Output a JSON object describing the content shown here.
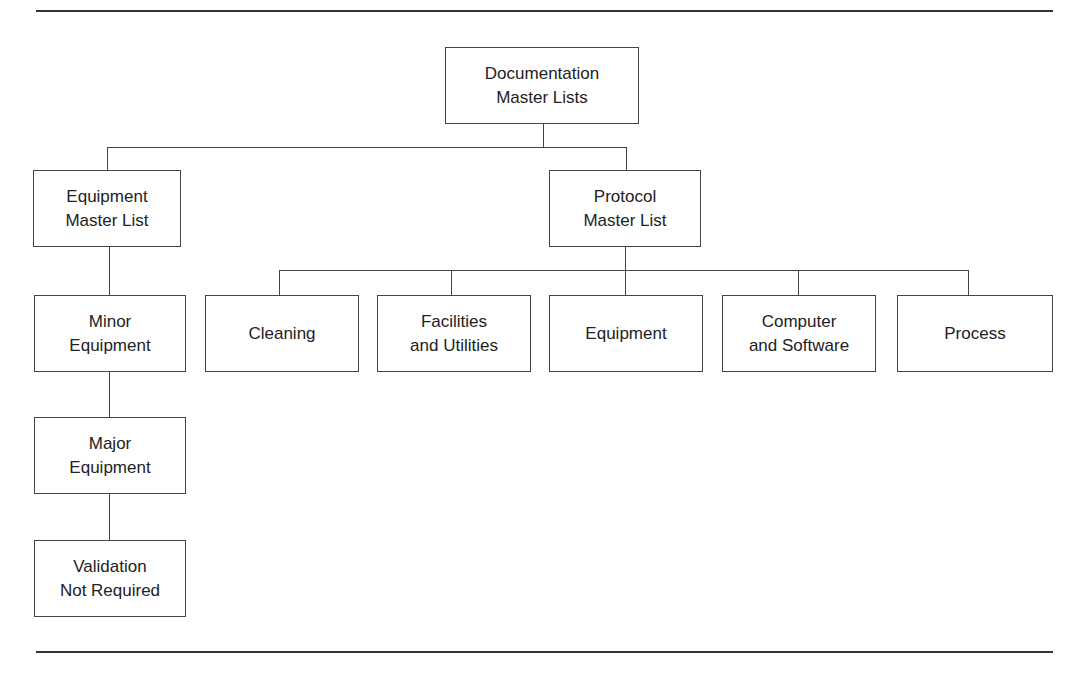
{
  "diagram": {
    "root": {
      "label": "Documentation\nMaster Lists"
    },
    "equipment_master": {
      "label": "Equipment\nMaster List"
    },
    "protocol_master": {
      "label": "Protocol\nMaster List"
    },
    "equipment_chain": [
      {
        "label": "Minor\nEquipment"
      },
      {
        "label": "Major\nEquipment"
      },
      {
        "label": "Validation\nNot Required"
      }
    ],
    "protocol_children": [
      {
        "label": "Cleaning"
      },
      {
        "label": "Facilities\nand Utilities"
      },
      {
        "label": "Equipment"
      },
      {
        "label": "Computer\nand Software"
      },
      {
        "label": "Process"
      }
    ]
  }
}
